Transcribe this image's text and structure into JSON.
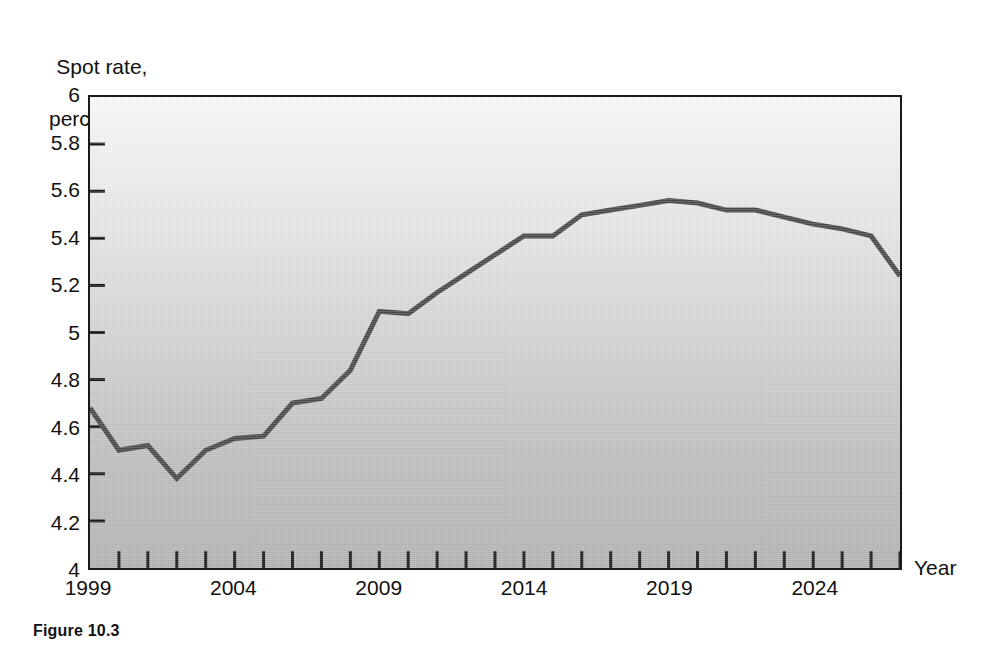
{
  "figure": {
    "caption": "Figure 10.3"
  },
  "axes": {
    "y_title_line1": "Spot rate,",
    "y_title_line2": "percent",
    "x_title": "Year",
    "y_tick_labels": [
      "6",
      "5.8",
      "5.6",
      "5.4",
      "5.2",
      "5",
      "4.8",
      "4.6",
      "4.4",
      "4.2",
      "4"
    ],
    "x_tick_labels": [
      "1999",
      "2004",
      "2009",
      "2014",
      "2019",
      "2024"
    ]
  },
  "colors": {
    "line": "#4a4a4a",
    "axis": "#1a1a1a",
    "plot_bg_top": "#f8f8f8",
    "plot_bg_bottom": "#b2b3b3",
    "text": "#111111"
  },
  "chart_data": {
    "type": "line",
    "title": "",
    "xlabel": "Year",
    "ylabel": "Spot rate, percent",
    "xlim": [
      1999,
      2027
    ],
    "ylim": [
      4,
      6
    ],
    "ytick_step": 0.2,
    "xtick_step": 1,
    "xtick_label_step": 5,
    "grid": false,
    "legend": false,
    "series": [
      {
        "name": "Spot rate",
        "x": [
          1999,
          2000,
          2001,
          2002,
          2003,
          2004,
          2005,
          2006,
          2007,
          2008,
          2009,
          2010,
          2011,
          2012,
          2013,
          2014,
          2015,
          2016,
          2017,
          2018,
          2019,
          2020,
          2021,
          2022,
          2023,
          2024,
          2025,
          2026,
          2027
        ],
        "values": [
          4.68,
          4.5,
          4.52,
          4.38,
          4.5,
          4.55,
          4.56,
          4.7,
          4.72,
          4.84,
          5.09,
          5.08,
          5.17,
          5.25,
          5.33,
          5.41,
          5.41,
          5.5,
          5.52,
          5.54,
          5.56,
          5.55,
          5.52,
          5.52,
          5.49,
          5.46,
          5.44,
          5.41,
          5.24
        ]
      }
    ]
  }
}
